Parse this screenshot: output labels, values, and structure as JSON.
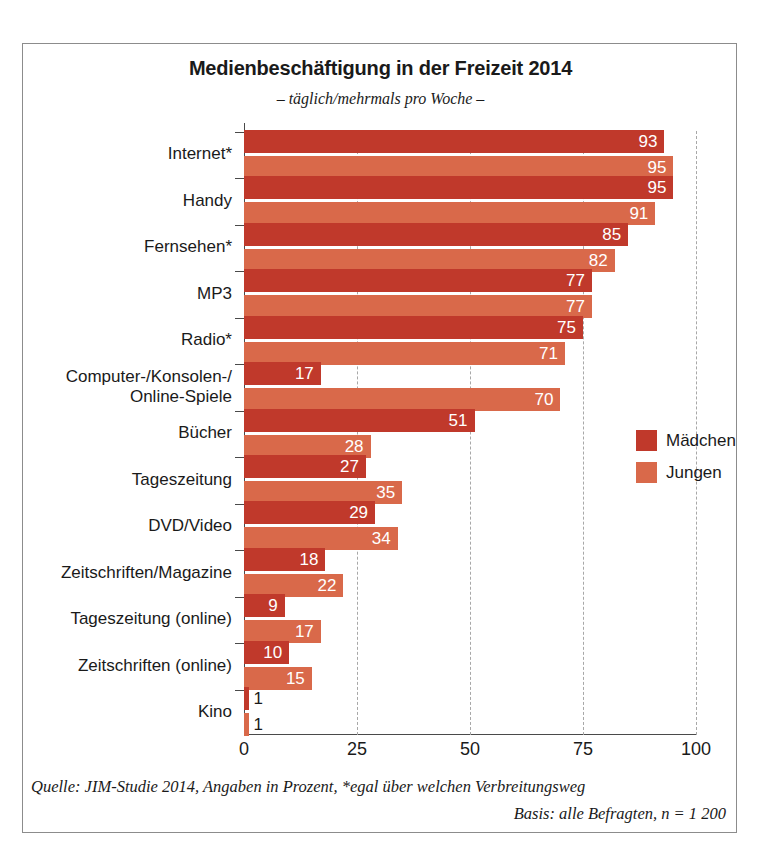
{
  "chart_data": {
    "type": "bar",
    "orientation": "horizontal",
    "title": "Medienbeschäftigung in der Freizeit 2014",
    "subtitle": "– täglich/mehrmals pro Woche –",
    "xlabel": "",
    "ylabel": "",
    "xlim": [
      0,
      100
    ],
    "xticks": [
      "0",
      "25",
      "50",
      "75",
      "100"
    ],
    "grid": "vertical-dashed",
    "legend_position": "right-middle",
    "categories": [
      "Internet*",
      "Handy",
      "Fernsehen*",
      "MP3",
      "Radio*",
      "Computer-/Konsolen-/\nOnline-Spiele",
      "Bücher",
      "Tageszeitung",
      "DVD/Video",
      "Zeitschriften/Magazine",
      "Tageszeitung (online)",
      "Zeitschriften (online)",
      "Kino"
    ],
    "series": [
      {
        "name": "Mädchen",
        "color": "#c0392b",
        "values": [
          93,
          95,
          85,
          77,
          75,
          17,
          51,
          27,
          29,
          18,
          9,
          10,
          1
        ]
      },
      {
        "name": "Jungen",
        "color": "#d9694a",
        "values": [
          95,
          91,
          82,
          77,
          71,
          70,
          28,
          35,
          34,
          22,
          17,
          15,
          1
        ]
      }
    ],
    "source": "Quelle: JIM-Studie 2014, Angaben in Prozent, *egal über welchen Verbreitungsweg",
    "basis": "Basis: alle Befragten, n = 1 200"
  },
  "categories_display": [
    {
      "lines": [
        "Internet*"
      ]
    },
    {
      "lines": [
        "Handy"
      ]
    },
    {
      "lines": [
        "Fernsehen*"
      ]
    },
    {
      "lines": [
        "MP3"
      ]
    },
    {
      "lines": [
        "Radio*"
      ]
    },
    {
      "lines": [
        "Computer-/Konsolen-/",
        "Online-Spiele"
      ]
    },
    {
      "lines": [
        "Bücher"
      ]
    },
    {
      "lines": [
        "Tageszeitung"
      ]
    },
    {
      "lines": [
        "DVD/Video"
      ]
    },
    {
      "lines": [
        "Zeitschriften/Magazine"
      ]
    },
    {
      "lines": [
        "Tageszeitung (online)"
      ]
    },
    {
      "lines": [
        "Zeitschriften (online)"
      ]
    },
    {
      "lines": [
        "Kino"
      ]
    }
  ],
  "legend": {
    "items": [
      {
        "label": "Mädchen",
        "color": "#c0392b",
        "key": "maedchen"
      },
      {
        "label": "Jungen",
        "color": "#d9694a",
        "key": "jungen"
      }
    ]
  },
  "footer": {
    "source": "Quelle: JIM-Studie 2014, Angaben in Prozent, *egal über welchen Verbreitungsweg",
    "basis": "Basis: alle Befragten, n = 1 200"
  }
}
